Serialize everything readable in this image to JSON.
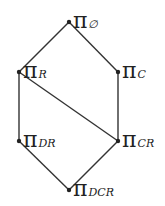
{
  "diagram": {
    "type": "hasse-lattice",
    "nodes": [
      {
        "id": "empty",
        "symbol": "π",
        "subscript": "∅"
      },
      {
        "id": "R",
        "symbol": "π",
        "subscript": "R"
      },
      {
        "id": "C",
        "symbol": "π",
        "subscript": "C"
      },
      {
        "id": "DR",
        "symbol": "π",
        "subscript": "DR"
      },
      {
        "id": "CR",
        "symbol": "π",
        "subscript": "CR"
      },
      {
        "id": "DCR",
        "symbol": "π",
        "subscript": "DCR"
      }
    ],
    "edges": [
      [
        "empty",
        "R"
      ],
      [
        "empty",
        "C"
      ],
      [
        "R",
        "DR"
      ],
      [
        "R",
        "CR"
      ],
      [
        "C",
        "CR"
      ],
      [
        "DR",
        "DCR"
      ],
      [
        "CR",
        "DCR"
      ]
    ],
    "line_color": "#333333",
    "node_color": "#222222"
  }
}
